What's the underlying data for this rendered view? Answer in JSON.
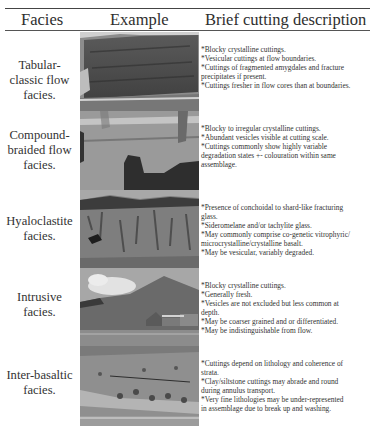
{
  "table": {
    "headers": {
      "facies": "Facies",
      "example": "Example",
      "description": "Brief cutting description"
    },
    "rows": [
      {
        "facies": [
          "Tabular-",
          "classic flow",
          "facies."
        ],
        "photo": "cliff-tabular-lava-flows-photo",
        "description": [
          "*Blocky crystalline cuttings.",
          "*Vesicular cuttings at flow boundaries.",
          "*Cuttings of fragmented amygdales and fracture",
          "precipitates if present.",
          "*Cuttings fresher in flow cores than at boundaries."
        ]
      },
      {
        "facies": [
          "Compound-",
          "braided flow",
          "facies."
        ],
        "photo": "outcrop-compound-braided-flows-photo",
        "description": [
          "*Blocky to irregular crystalline cuttings.",
          "*Abundant vesicles visible at cutting scale.",
          "*Cuttings commonly show highly variable",
          "degradation states +- colouration within same",
          "assemblage."
        ]
      },
      {
        "facies": [
          "Hyaloclastite",
          "facies."
        ],
        "photo": "outcrop-hyaloclastite-photo",
        "description": [
          "*Presence of conchoidal to shard-like fracturing",
          "glass.",
          "*Sideromelane and/or tachylite glass.",
          "*May commonly comprise co-genetic vitrophyric/",
          "microcrystalline/crystalline basalt.",
          "*May be vesicular, variably degraded."
        ]
      },
      {
        "facies": [
          "Intrusive",
          "facies."
        ],
        "photo": "hill-intrusion-with-farm-buildings-photo",
        "description": [
          "*Blocky crystalline cuttings.",
          "*Generally fresh.",
          "*Vesicles are not excluded but less common at",
          "depth.",
          "*May be coarser grained and or differentiated.",
          "*May be indistinguishable from flow."
        ]
      },
      {
        "facies": [
          "Inter-basaltic",
          "facies."
        ],
        "photo": "slope-inter-basaltic-strata-photo",
        "description": [
          "*Cuttings depend on lithology and coherence of",
          "strata.",
          "*Clay/siltstone cuttings may abrade and round",
          "during annulus transport.",
          "*Very fine lithologies may be under-represented",
          "in assemblage due to break up and washing."
        ]
      }
    ]
  }
}
